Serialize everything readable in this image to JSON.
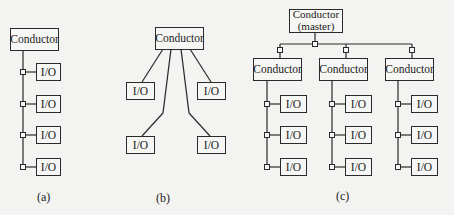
{
  "diagram": {
    "type": "network-topology-comparison",
    "panels": [
      {
        "id": "a",
        "caption": "(a)",
        "topology": "bus",
        "conductor": {
          "label": "Conductor"
        },
        "io_nodes": [
          {
            "label": "I/O"
          },
          {
            "label": "I/O"
          },
          {
            "label": "I/O"
          },
          {
            "label": "I/O"
          }
        ]
      },
      {
        "id": "b",
        "caption": "(b)",
        "topology": "star",
        "conductor": {
          "label": "Conductor"
        },
        "io_nodes": [
          {
            "label": "I/O"
          },
          {
            "label": "I/O"
          },
          {
            "label": "I/O"
          },
          {
            "label": "I/O"
          }
        ]
      },
      {
        "id": "c",
        "caption": "(c)",
        "topology": "hierarchical-bus",
        "master": {
          "label_line1": "Conductor",
          "label_line2": "(master)"
        },
        "sub_conductors": [
          {
            "label": "Conductor",
            "io_nodes": [
              {
                "label": "I/O"
              },
              {
                "label": "I/O"
              },
              {
                "label": "I/O"
              }
            ]
          },
          {
            "label": "Conductor",
            "io_nodes": [
              {
                "label": "I/O"
              },
              {
                "label": "I/O"
              },
              {
                "label": "I/O"
              }
            ]
          },
          {
            "label": "Conductor",
            "io_nodes": [
              {
                "label": "I/O"
              },
              {
                "label": "I/O"
              },
              {
                "label": "I/O"
              }
            ]
          }
        ]
      }
    ],
    "colors": {
      "background": "#f3f3f1",
      "stroke": "#2a2a2a",
      "text": "#222222"
    }
  }
}
